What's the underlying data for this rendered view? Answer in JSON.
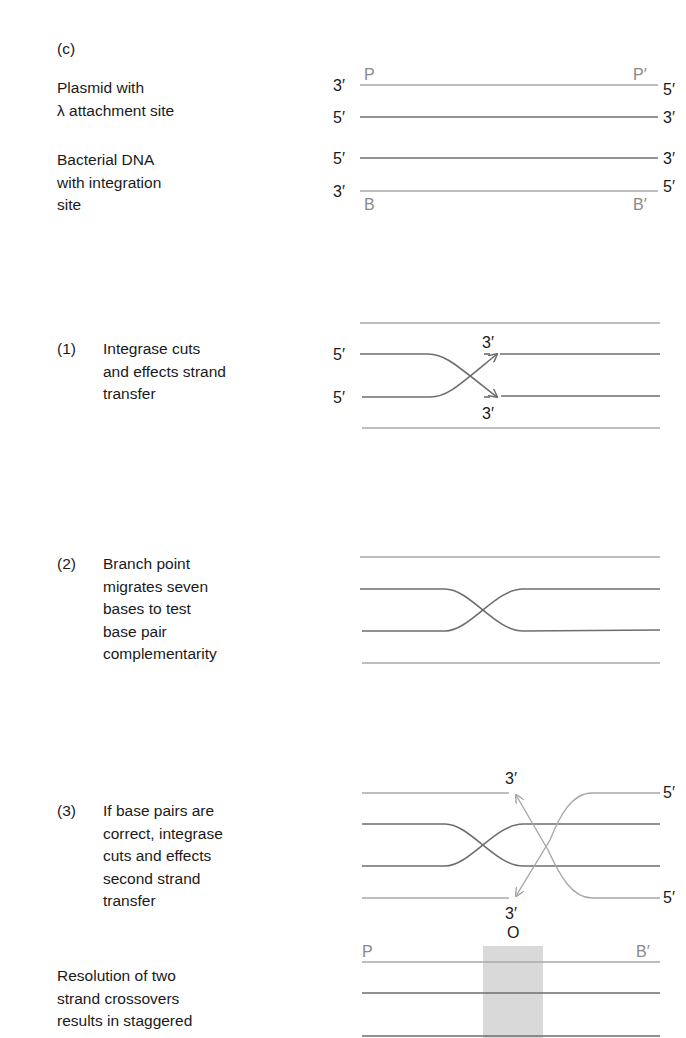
{
  "panel_label": "(c)",
  "intro": {
    "plasmid_label": "Plasmid with\nλ attachment site",
    "bacterial_label": "Bacterial DNA\nwith integration\nsite",
    "strand_ends": {
      "plasmid_top_left": "3′",
      "plasmid_top_right": "5′",
      "plasmid_bottom_left": "5′",
      "plasmid_bottom_right": "3′",
      "bacterial_top_left": "5′",
      "bacterial_top_right": "3′",
      "bacterial_bottom_left": "3′",
      "bacterial_bottom_right": "5′"
    },
    "site_labels": {
      "p": "P",
      "p_prime": "P′",
      "b": "B",
      "b_prime": "B′"
    }
  },
  "steps": [
    {
      "number": "(1)",
      "text": "Integrase cuts\nand effects strand\ntransfer",
      "labels": {
        "left_top": "5′",
        "left_bottom": "5′",
        "arrow_top": "3′",
        "arrow_bottom": "3′"
      }
    },
    {
      "number": "(2)",
      "text": "Branch point\nmigrates seven\nbases to test\nbase pair\ncomplementarity"
    },
    {
      "number": "(3)",
      "text": "If base pairs are\ncorrect, integrase\ncuts and effects\nsecond strand\ntransfer",
      "labels": {
        "arrow_top": "3′",
        "arrow_bottom": "3′",
        "right_top": "5′",
        "right_bottom": "5′"
      }
    }
  ],
  "resolution": {
    "text": "Resolution of two\nstrand crossovers\nresults in staggered",
    "labels": {
      "p": "P",
      "b_prime": "B′",
      "overlap": "O"
    }
  },
  "colors": {
    "dark_strand": "#6e6e6e",
    "light_strand": "#a8a8a8",
    "overlap_box": "#d9d9d9",
    "site_label": "#8a8a8a"
  }
}
